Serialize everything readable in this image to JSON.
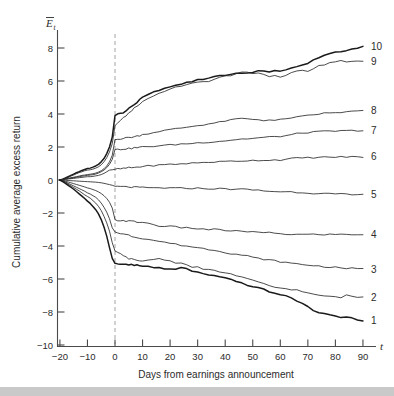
{
  "chart_data": {
    "type": "line",
    "title": "",
    "subtitle": "",
    "xlabel": "Days from earnings announcement",
    "ylabel": "Cumulative average excess return",
    "x_axis_symbol": "t",
    "y_axis_symbol": "E",
    "y_axis_symbol_sub": "t",
    "y_axis_symbol_overbar": true,
    "xlim": [
      -20,
      90
    ],
    "ylim": [
      -10,
      8
    ],
    "xticks": [
      -20,
      -10,
      0,
      10,
      20,
      30,
      40,
      50,
      60,
      70,
      80,
      90
    ],
    "xtick_labels": [
      "−20",
      "−10",
      "0",
      "10",
      "20",
      "30",
      "40",
      "50",
      "60",
      "70",
      "80",
      "90"
    ],
    "yticks": [
      8,
      6,
      4,
      2,
      0,
      -2,
      -4,
      -6,
      -8,
      -10
    ],
    "ytick_labels": [
      "8",
      "6",
      "4",
      "2",
      "0",
      "−2",
      "−4",
      "−6",
      "−8",
      "−10"
    ],
    "grid": false,
    "legend_position": "right-end-labels",
    "annotations": [
      {
        "name": "announcement-line",
        "type": "vline",
        "x": 0,
        "style": "dashed",
        "color": "#9a9a9a"
      }
    ],
    "line_color": "#2b2b2b",
    "emphasis_color": "#1a1a1a",
    "x": [
      -20,
      -19,
      -18,
      -17,
      -16,
      -15,
      -14,
      -13,
      -12,
      -11,
      -10,
      -9,
      -8,
      -7,
      -6,
      -5,
      -4,
      -3,
      -2,
      -1,
      0,
      1,
      2,
      3,
      4,
      5,
      6,
      7,
      8,
      9,
      10,
      12,
      14,
      16,
      18,
      20,
      22,
      24,
      26,
      28,
      30,
      32,
      34,
      36,
      38,
      40,
      42,
      44,
      46,
      48,
      50,
      52,
      54,
      56,
      58,
      60,
      62,
      64,
      66,
      68,
      70,
      72,
      74,
      76,
      78,
      80,
      82,
      84,
      86,
      88,
      90
    ],
    "series": [
      {
        "name": "10",
        "label": "10",
        "emphasis": true,
        "end_value": 8.1,
        "values": [
          0,
          0.05,
          0.12,
          0.2,
          0.28,
          0.36,
          0.44,
          0.5,
          0.58,
          0.64,
          0.7,
          0.72,
          0.78,
          0.85,
          0.95,
          1.1,
          1.3,
          1.6,
          2.0,
          2.6,
          3.9,
          4.0,
          4.05,
          4.1,
          4.2,
          4.35,
          4.5,
          4.6,
          4.7,
          4.85,
          5.0,
          5.2,
          5.35,
          5.45,
          5.55,
          5.6,
          5.7,
          5.8,
          5.9,
          5.95,
          6.05,
          6.1,
          6.2,
          6.25,
          6.3,
          6.35,
          6.4,
          6.5,
          6.5,
          6.5,
          6.55,
          6.6,
          6.6,
          6.55,
          6.6,
          6.6,
          6.7,
          6.8,
          6.9,
          7.0,
          7.1,
          7.25,
          7.45,
          7.6,
          7.7,
          7.75,
          7.8,
          7.85,
          7.95,
          8.0,
          8.1
        ]
      },
      {
        "name": "9",
        "label": "9",
        "emphasis": false,
        "end_value": 7.2,
        "values": [
          0,
          0.04,
          0.1,
          0.16,
          0.24,
          0.3,
          0.38,
          0.45,
          0.5,
          0.56,
          0.6,
          0.62,
          0.66,
          0.72,
          0.8,
          0.92,
          1.1,
          1.35,
          1.7,
          2.2,
          3.3,
          3.5,
          3.6,
          3.75,
          3.9,
          4.05,
          4.2,
          4.35,
          4.5,
          4.6,
          4.75,
          4.95,
          5.1,
          5.25,
          5.4,
          5.5,
          5.6,
          5.7,
          5.8,
          5.85,
          5.9,
          5.95,
          6.0,
          6.1,
          6.2,
          6.3,
          6.35,
          6.45,
          6.5,
          6.5,
          6.45,
          6.5,
          6.4,
          6.3,
          6.3,
          6.25,
          6.35,
          6.5,
          6.6,
          6.65,
          6.6,
          6.7,
          6.9,
          7.0,
          7.1,
          7.2,
          7.2,
          7.15,
          7.2,
          7.2,
          7.2
        ]
      },
      {
        "name": "8",
        "label": "8",
        "emphasis": false,
        "end_value": 4.2,
        "values": [
          0,
          0.03,
          0.07,
          0.1,
          0.14,
          0.17,
          0.2,
          0.24,
          0.28,
          0.3,
          0.33,
          0.35,
          0.38,
          0.42,
          0.48,
          0.56,
          0.68,
          0.85,
          1.1,
          1.5,
          2.45,
          2.5,
          2.5,
          2.52,
          2.55,
          2.58,
          2.6,
          2.62,
          2.66,
          2.7,
          2.75,
          2.82,
          2.88,
          2.95,
          3.0,
          3.05,
          3.1,
          3.15,
          3.2,
          3.25,
          3.3,
          3.35,
          3.4,
          3.45,
          3.5,
          3.58,
          3.62,
          3.7,
          3.72,
          3.7,
          3.68,
          3.66,
          3.62,
          3.65,
          3.6,
          3.65,
          3.7,
          3.78,
          3.8,
          3.85,
          3.9,
          3.95,
          4.0,
          4.05,
          4.05,
          4.08,
          4.1,
          4.12,
          4.15,
          4.18,
          4.2
        ]
      },
      {
        "name": "7",
        "label": "7",
        "emphasis": false,
        "end_value": 3.0,
        "values": [
          0,
          0.02,
          0.05,
          0.08,
          0.11,
          0.14,
          0.17,
          0.2,
          0.23,
          0.25,
          0.28,
          0.3,
          0.32,
          0.36,
          0.42,
          0.5,
          0.6,
          0.75,
          0.95,
          1.25,
          1.85,
          1.85,
          1.86,
          1.88,
          1.9,
          1.9,
          1.92,
          1.95,
          1.96,
          1.98,
          2.0,
          2.02,
          2.05,
          2.08,
          2.1,
          2.12,
          2.15,
          2.18,
          2.2,
          2.22,
          2.25,
          2.28,
          2.3,
          2.32,
          2.35,
          2.38,
          2.42,
          2.45,
          2.48,
          2.5,
          2.52,
          2.55,
          2.58,
          2.6,
          2.62,
          2.65,
          2.68,
          2.75,
          2.8,
          2.85,
          2.88,
          2.9,
          2.92,
          2.95,
          2.95,
          2.96,
          2.97,
          2.98,
          2.99,
          3.0,
          3.0
        ]
      },
      {
        "name": "6",
        "label": "6",
        "emphasis": false,
        "end_value": 1.4,
        "values": [
          0,
          0.02,
          0.04,
          0.06,
          0.08,
          0.1,
          0.12,
          0.14,
          0.16,
          0.18,
          0.2,
          0.2,
          0.22,
          0.25,
          0.28,
          0.33,
          0.4,
          0.5,
          0.6,
          0.62,
          0.65,
          0.66,
          0.68,
          0.7,
          0.72,
          0.74,
          0.75,
          0.76,
          0.78,
          0.8,
          0.82,
          0.85,
          0.88,
          0.9,
          0.92,
          0.95,
          0.96,
          0.98,
          1.0,
          1.02,
          1.04,
          1.06,
          1.08,
          1.1,
          1.1,
          1.12,
          1.14,
          1.15,
          1.16,
          1.18,
          1.18,
          1.2,
          1.2,
          1.2,
          1.22,
          1.22,
          1.24,
          1.3,
          1.32,
          1.34,
          1.35,
          1.36,
          1.37,
          1.38,
          1.38,
          1.39,
          1.4,
          1.4,
          1.4,
          1.4,
          1.4
        ]
      },
      {
        "name": "5",
        "label": "5",
        "emphasis": false,
        "end_value": -0.9,
        "values": [
          0,
          -0.01,
          -0.02,
          -0.03,
          -0.04,
          -0.05,
          -0.06,
          -0.07,
          -0.08,
          -0.09,
          -0.1,
          -0.11,
          -0.12,
          -0.13,
          -0.15,
          -0.17,
          -0.2,
          -0.24,
          -0.28,
          -0.32,
          -0.38,
          -0.4,
          -0.4,
          -0.41,
          -0.42,
          -0.42,
          -0.43,
          -0.44,
          -0.45,
          -0.45,
          -0.46,
          -0.47,
          -0.48,
          -0.48,
          -0.48,
          -0.49,
          -0.5,
          -0.5,
          -0.5,
          -0.5,
          -0.5,
          -0.52,
          -0.52,
          -0.53,
          -0.53,
          -0.54,
          -0.55,
          -0.55,
          -0.56,
          -0.58,
          -0.6,
          -0.62,
          -0.66,
          -0.68,
          -0.7,
          -0.7,
          -0.72,
          -0.72,
          -0.74,
          -0.76,
          -0.78,
          -0.8,
          -0.8,
          -0.82,
          -0.84,
          -0.86,
          -0.86,
          -0.88,
          -0.9,
          -0.9,
          -0.9
        ]
      },
      {
        "name": "4",
        "label": "4",
        "emphasis": false,
        "end_value": -3.3,
        "values": [
          0,
          -0.04,
          -0.08,
          -0.12,
          -0.17,
          -0.22,
          -0.27,
          -0.32,
          -0.37,
          -0.42,
          -0.48,
          -0.52,
          -0.58,
          -0.64,
          -0.72,
          -0.82,
          -0.95,
          -1.12,
          -1.35,
          -1.7,
          -2.4,
          -2.45,
          -2.45,
          -2.46,
          -2.48,
          -2.5,
          -2.5,
          -2.52,
          -2.55,
          -2.56,
          -2.58,
          -2.62,
          -2.7,
          -2.78,
          -2.8,
          -2.82,
          -2.85,
          -2.88,
          -2.9,
          -2.92,
          -2.95,
          -2.98,
          -3.0,
          -3.0,
          -3.02,
          -3.05,
          -3.08,
          -3.1,
          -3.1,
          -3.12,
          -3.15,
          -3.18,
          -3.2,
          -3.2,
          -3.22,
          -3.25,
          -3.28,
          -3.3,
          -3.3,
          -3.3,
          -3.3,
          -3.3,
          -3.3,
          -3.3,
          -3.3,
          -3.3,
          -3.3,
          -3.3,
          -3.3,
          -3.3,
          -3.3
        ]
      },
      {
        "name": "3",
        "label": "3",
        "emphasis": false,
        "end_value": -5.4,
        "values": [
          0,
          -0.06,
          -0.12,
          -0.2,
          -0.28,
          -0.36,
          -0.44,
          -0.52,
          -0.6,
          -0.68,
          -0.78,
          -0.85,
          -0.95,
          -1.05,
          -1.2,
          -1.4,
          -1.65,
          -1.95,
          -2.35,
          -2.9,
          -3.15,
          -3.18,
          -3.22,
          -3.28,
          -3.32,
          -3.35,
          -3.4,
          -3.45,
          -3.48,
          -3.5,
          -3.55,
          -3.6,
          -3.65,
          -3.72,
          -3.78,
          -3.82,
          -3.9,
          -3.95,
          -4.0,
          -4.05,
          -4.1,
          -4.15,
          -4.2,
          -4.25,
          -4.3,
          -4.38,
          -4.45,
          -4.5,
          -4.55,
          -4.6,
          -4.7,
          -4.75,
          -4.8,
          -4.85,
          -4.9,
          -4.95,
          -5.0,
          -5.05,
          -5.08,
          -5.12,
          -5.15,
          -5.18,
          -5.22,
          -5.25,
          -5.28,
          -5.3,
          -5.32,
          -5.35,
          -5.36,
          -5.38,
          -5.4
        ]
      },
      {
        "name": "2",
        "label": "2",
        "emphasis": false,
        "end_value": -7.1,
        "values": [
          0,
          -0.08,
          -0.16,
          -0.26,
          -0.36,
          -0.46,
          -0.56,
          -0.66,
          -0.78,
          -0.9,
          -1.0,
          -1.1,
          -1.25,
          -1.4,
          -1.6,
          -1.85,
          -2.2,
          -2.6,
          -3.1,
          -3.8,
          -4.3,
          -4.4,
          -4.5,
          -4.6,
          -4.68,
          -4.75,
          -4.8,
          -4.85,
          -4.9,
          -4.92,
          -4.9,
          -4.85,
          -4.8,
          -4.78,
          -4.82,
          -4.9,
          -5.0,
          -5.05,
          -5.15,
          -5.25,
          -5.3,
          -5.4,
          -5.45,
          -5.5,
          -5.55,
          -5.62,
          -5.7,
          -5.8,
          -5.9,
          -6.0,
          -6.1,
          -6.2,
          -6.3,
          -6.4,
          -6.5,
          -6.55,
          -6.58,
          -6.62,
          -6.68,
          -6.75,
          -6.85,
          -6.95,
          -7.0,
          -7.02,
          -7.05,
          -7.1,
          -7.1,
          -7.0,
          -7.05,
          -7.1,
          -7.1
        ]
      },
      {
        "name": "1",
        "label": "1",
        "emphasis": true,
        "end_value": -8.5,
        "values": [
          0,
          -0.1,
          -0.2,
          -0.32,
          -0.44,
          -0.56,
          -0.7,
          -0.84,
          -0.98,
          -1.12,
          -1.28,
          -1.42,
          -1.6,
          -1.8,
          -2.05,
          -2.4,
          -2.85,
          -3.4,
          -4.1,
          -4.75,
          -5.05,
          -5.1,
          -5.12,
          -5.1,
          -5.12,
          -5.15,
          -5.12,
          -5.15,
          -5.18,
          -5.2,
          -5.22,
          -5.25,
          -5.3,
          -5.35,
          -5.4,
          -5.42,
          -5.4,
          -5.3,
          -5.4,
          -5.5,
          -5.6,
          -5.7,
          -5.75,
          -5.82,
          -5.9,
          -5.95,
          -6.05,
          -6.15,
          -6.25,
          -6.35,
          -6.45,
          -6.55,
          -6.65,
          -6.75,
          -6.85,
          -6.95,
          -7.05,
          -7.15,
          -7.3,
          -7.5,
          -7.7,
          -7.9,
          -8.0,
          -8.1,
          -8.2,
          -8.25,
          -8.3,
          -8.35,
          -8.4,
          -8.45,
          -8.5
        ]
      }
    ]
  },
  "labels": {
    "y_axis_title": "Cumulative average excess return",
    "x_axis_title": "Days from earnings announcement",
    "x_axis_symbol": "t",
    "y_axis_symbol": "E",
    "y_axis_symbol_sub": "t"
  }
}
